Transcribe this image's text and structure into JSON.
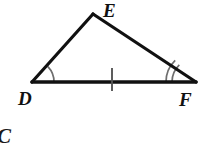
{
  "figure": {
    "kind": "geometry-diagram",
    "background_color": "#ffffff",
    "stroke_color": "#111111",
    "mark_color": "#6e6e6e",
    "tick_color": "#555555",
    "vertices": [
      {
        "id": "D",
        "label": "D",
        "x": 32,
        "y": 82,
        "label_x": 18,
        "label_y": 105
      },
      {
        "id": "E",
        "label": "E",
        "x": 93,
        "y": 14,
        "label_x": 103,
        "label_y": 17
      },
      {
        "id": "F",
        "label": "F",
        "x": 196,
        "y": 82,
        "label_x": 179,
        "label_y": 106
      }
    ],
    "edges": [
      {
        "id": "DE",
        "from": "D",
        "to": "E",
        "width": 3.2
      },
      {
        "id": "EF",
        "from": "E",
        "to": "F",
        "width": 3.2
      },
      {
        "id": "DF",
        "from": "D",
        "to": "F",
        "width": 3.6
      }
    ],
    "angle_marks": [
      {
        "at": "D",
        "arcs": 1,
        "radius": 22,
        "label": "single-arc-angle-D"
      },
      {
        "at": "F",
        "arcs": 2,
        "radius": 24,
        "spacing": 6,
        "label": "double-arc-angle-F"
      }
    ],
    "tick_marks": [
      {
        "on": "DF",
        "count": 1,
        "x": 112,
        "y_top": 68,
        "y_bottom": 91
      }
    ],
    "stray_text": {
      "text": "C",
      "x": -2,
      "y": 142
    }
  }
}
